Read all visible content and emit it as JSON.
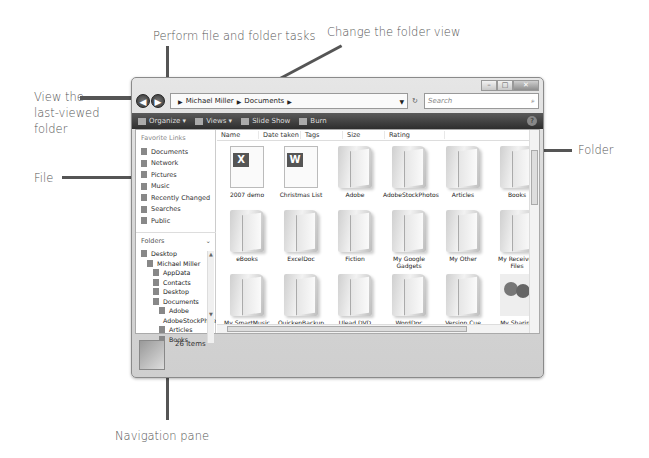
{
  "callouts": {
    "perform_tasks": "Perform file and folder tasks",
    "change_view": "Change the folder view",
    "last_viewed": [
      "View the",
      "last-viewed",
      "folder"
    ],
    "file": "File",
    "folder": "Folder",
    "navigation_pane": "Navigation pane"
  },
  "window": {
    "title_buttons": [
      "minimize",
      "maximize",
      "close"
    ],
    "address": {
      "crumbs": [
        "Michael Miller",
        "Documents"
      ],
      "search_placeholder": "Search"
    },
    "toolbar": {
      "organize": "Organize",
      "views": "Views",
      "slideshow": "Slide Show",
      "burn": "Burn"
    },
    "nav": {
      "favorites_header": "Favorite Links",
      "favorites": [
        "Documents",
        "Network",
        "Pictures",
        "Music",
        "Recently Changed",
        "Searches",
        "Public"
      ],
      "folders_header": "Folders",
      "tree": [
        {
          "label": "Desktop",
          "indent": 0
        },
        {
          "label": "Michael Miller",
          "indent": 1
        },
        {
          "label": "AppData",
          "indent": 2
        },
        {
          "label": "Contacts",
          "indent": 2
        },
        {
          "label": "Desktop",
          "indent": 2
        },
        {
          "label": "Documents",
          "indent": 2
        },
        {
          "label": "Adobe",
          "indent": 3
        },
        {
          "label": "AdobeStockPhotos",
          "indent": 3
        },
        {
          "label": "Articles",
          "indent": 3
        },
        {
          "label": "Books",
          "indent": 3
        },
        {
          "label": "DeductionPro",
          "indent": 3
        },
        {
          "label": "eBooks",
          "indent": 3
        }
      ]
    },
    "columns": [
      "Name",
      "Date taken",
      "Tags",
      "Size",
      "Rating"
    ],
    "items": [
      {
        "label": "2007 demo",
        "type": "excel"
      },
      {
        "label": "Christmas List",
        "type": "word"
      },
      {
        "label": "Adobe",
        "type": "folder"
      },
      {
        "label": "AdobeStockPhotos",
        "type": "folder"
      },
      {
        "label": "Articles",
        "type": "docfolder"
      },
      {
        "label": "Books",
        "type": "folder"
      },
      {
        "label": "eBooks",
        "type": "folder"
      },
      {
        "label": "ExcelDoc",
        "type": "folder"
      },
      {
        "label": "Fiction",
        "type": "folder"
      },
      {
        "label": "My Google Gadgets",
        "type": "folder"
      },
      {
        "label": "My Other",
        "type": "folder"
      },
      {
        "label": "My Received Files",
        "type": "folder"
      },
      {
        "label": "My SmartMusic",
        "type": "folder"
      },
      {
        "label": "QuickenBackup",
        "type": "folder"
      },
      {
        "label": "Ulead DVD",
        "type": "folder"
      },
      {
        "label": "WordDoc",
        "type": "folder"
      },
      {
        "label": "Version Cue",
        "type": "folder"
      },
      {
        "label": "My Sharing Folders",
        "type": "people"
      }
    ],
    "details": {
      "count": "26 items"
    }
  }
}
